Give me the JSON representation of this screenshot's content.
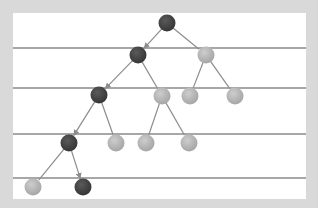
{
  "diagram": {
    "type": "binary-tree",
    "colors": {
      "background": "#d9d9d9",
      "panel": "#ffffff",
      "level_line": "#8a8a8a",
      "edge": "#8c8c8c",
      "node_dark": "#3e3e3e",
      "node_light": "#b4b4b4"
    },
    "level_lines_y": [
      48,
      88,
      134,
      178
    ],
    "nodes": [
      {
        "id": "n0",
        "x": 167,
        "y": 23,
        "style": "dark"
      },
      {
        "id": "n1",
        "x": 138,
        "y": 55,
        "style": "dark"
      },
      {
        "id": "n2",
        "x": 206,
        "y": 55,
        "style": "light"
      },
      {
        "id": "n3",
        "x": 99,
        "y": 95,
        "style": "dark"
      },
      {
        "id": "n4",
        "x": 162,
        "y": 96,
        "style": "light"
      },
      {
        "id": "n5",
        "x": 190,
        "y": 96,
        "style": "light"
      },
      {
        "id": "n6",
        "x": 235,
        "y": 96,
        "style": "light"
      },
      {
        "id": "n7",
        "x": 69,
        "y": 143,
        "style": "dark"
      },
      {
        "id": "n8",
        "x": 116,
        "y": 143,
        "style": "light"
      },
      {
        "id": "n9",
        "x": 146,
        "y": 143,
        "style": "light"
      },
      {
        "id": "n10",
        "x": 189,
        "y": 143,
        "style": "light"
      },
      {
        "id": "n11",
        "x": 33,
        "y": 187,
        "style": "light"
      },
      {
        "id": "n12",
        "x": 83,
        "y": 187,
        "style": "dark"
      }
    ],
    "edges": [
      {
        "from": "n0",
        "to": "n1",
        "arrow": true
      },
      {
        "from": "n0",
        "to": "n2",
        "arrow": false
      },
      {
        "from": "n1",
        "to": "n3",
        "arrow": true
      },
      {
        "from": "n1",
        "to": "n4",
        "arrow": false
      },
      {
        "from": "n2",
        "to": "n5",
        "arrow": false
      },
      {
        "from": "n2",
        "to": "n6",
        "arrow": false
      },
      {
        "from": "n3",
        "to": "n7",
        "arrow": true
      },
      {
        "from": "n3",
        "to": "n8",
        "arrow": false
      },
      {
        "from": "n4",
        "to": "n9",
        "arrow": false
      },
      {
        "from": "n4",
        "to": "n10",
        "arrow": false
      },
      {
        "from": "n7",
        "to": "n11",
        "arrow": false
      },
      {
        "from": "n7",
        "to": "n12",
        "arrow": true
      }
    ],
    "node_radius": 8.5
  }
}
